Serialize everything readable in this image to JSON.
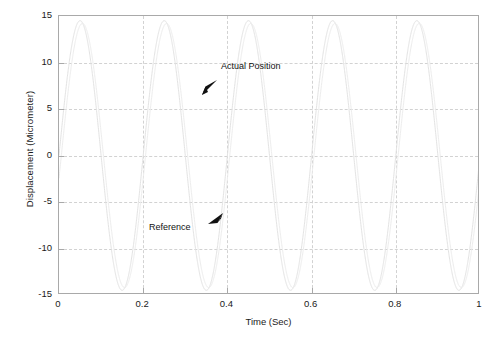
{
  "chart_data": {
    "type": "line",
    "title": "",
    "xlabel": "Time (Sec)",
    "ylabel": "Displacement (Micrometer)",
    "xlim": [
      0,
      1
    ],
    "ylim": [
      -15,
      15
    ],
    "xticks": [
      "0",
      "0.2",
      "0.4",
      "0.6",
      "0.8",
      "1"
    ],
    "xtick_values": [
      0,
      0.2,
      0.4,
      0.6,
      0.8,
      1
    ],
    "yticks": [
      "15",
      "10",
      "5",
      "0",
      "-5",
      "-10",
      "-15"
    ],
    "ytick_values": [
      15,
      10,
      5,
      0,
      -5,
      -10,
      -15
    ],
    "grid": true,
    "grid_style": "dashed",
    "grid_color": "#d2d2d2",
    "axis_color": "#a9a9a9",
    "legend": "none",
    "series": [
      {
        "name": "Reference",
        "color": "#e3e3e3",
        "waveform": "sine",
        "amplitude": 14.5,
        "frequency_hz": 5,
        "phase_deg": 0,
        "samples_x": [
          0,
          0.05,
          0.1,
          0.15,
          0.2,
          0.25,
          0.3,
          0.35,
          0.4,
          0.45,
          0.5,
          0.55,
          0.6,
          0.65,
          0.7,
          0.75,
          0.8,
          0.85,
          0.9,
          0.95,
          1
        ],
        "samples_y": [
          0,
          14.5,
          0,
          -14.5,
          0,
          14.5,
          0,
          -14.5,
          0,
          14.5,
          0,
          -14.5,
          0,
          14.5,
          0,
          -14.5,
          0,
          14.5,
          0,
          -14.5,
          0
        ]
      },
      {
        "name": "Actual Position",
        "color": "#ededed",
        "waveform": "sine",
        "amplitude": 14.2,
        "frequency_hz": 5,
        "phase_deg": -10,
        "samples_x": [
          0,
          0.05,
          0.1,
          0.15,
          0.2,
          0.25,
          0.3,
          0.35,
          0.4,
          0.45,
          0.5,
          0.55,
          0.6,
          0.65,
          0.7,
          0.75,
          0.8,
          0.85,
          0.9,
          0.95,
          1
        ],
        "samples_y": [
          -2.5,
          14.0,
          2.5,
          -14.0,
          -2.5,
          14.0,
          2.5,
          -14.0,
          -2.5,
          14.0,
          2.5,
          -14.0,
          -2.5,
          14.0,
          2.5,
          -14.0,
          -2.5,
          14.0,
          2.5,
          -14.0,
          -2.5
        ]
      }
    ],
    "annotations": [
      {
        "name": "actual-position",
        "text": "Actual Position",
        "text_x": 0.385,
        "text_y": 9.6,
        "arrow_tip_x": 0.33,
        "arrow_tip_y": 7.3,
        "arrow_dir": "down-left"
      },
      {
        "name": "reference",
        "text": "Reference",
        "text_x": 0.255,
        "text_y": -7.6,
        "arrow_tip_x": 0.375,
        "arrow_tip_y": -5.5,
        "arrow_dir": "up-right"
      }
    ]
  }
}
